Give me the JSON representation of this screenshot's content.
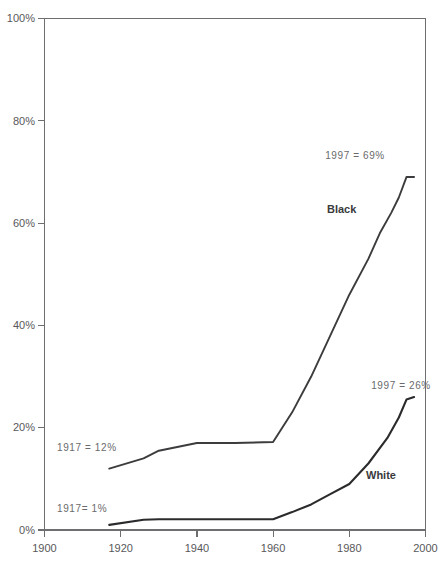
{
  "chart_data": {
    "type": "line",
    "title": "",
    "xlabel": "",
    "ylabel": "",
    "xlim": [
      1900,
      2000
    ],
    "ylim": [
      0,
      100
    ],
    "grid": false,
    "legend_position": "inline-labels",
    "xticks": [
      1900,
      1920,
      1940,
      1960,
      1980,
      2000
    ],
    "xtick_labels": [
      "1900",
      "1920",
      "1940",
      "1960",
      "1980",
      "2000"
    ],
    "yticks": [
      0,
      20,
      40,
      60,
      80,
      100
    ],
    "ytick_labels": [
      "0%",
      "20%",
      "40%",
      "60%",
      "80%",
      "100%"
    ],
    "series": [
      {
        "name": "Black",
        "label": "Black",
        "x": [
          1917,
          1926,
          1930,
          1940,
          1950,
          1960,
          1965,
          1970,
          1975,
          1980,
          1985,
          1988,
          1991,
          1993,
          1995,
          1997
        ],
        "values": [
          12,
          14,
          15.5,
          17,
          17,
          17.2,
          23,
          30,
          38,
          46,
          53,
          58,
          62,
          65,
          69,
          69
        ]
      },
      {
        "name": "White",
        "label": "White",
        "x": [
          1917,
          1926,
          1930,
          1940,
          1950,
          1960,
          1965,
          1970,
          1975,
          1980,
          1985,
          1990,
          1993,
          1995,
          1997
        ],
        "values": [
          1,
          2,
          2.1,
          2.1,
          2.1,
          2.1,
          3.5,
          5,
          7,
          9,
          13,
          18,
          22,
          25.5,
          26
        ]
      }
    ],
    "annotations": [
      {
        "name": "black-start-annotation",
        "text": "1917 = 12%",
        "x": 1917,
        "y": 12
      },
      {
        "name": "white-start-annotation",
        "text": "1917= 1%",
        "x": 1917,
        "y": 1
      },
      {
        "name": "black-end-annotation",
        "text": "1997 = 69%",
        "x": 1997,
        "y": 69
      },
      {
        "name": "white-end-annotation",
        "text": "1997 = 26%",
        "x": 1997,
        "y": 26
      }
    ]
  },
  "axis": {
    "y_labels": [
      "100%",
      "80%",
      "60%",
      "40%",
      "20%",
      "0%"
    ],
    "x_labels": [
      "1900",
      "1920",
      "1940",
      "1960",
      "1980",
      "2000"
    ]
  },
  "labels": {
    "black": "Black",
    "white": "White",
    "black_start": "1917 = 12%",
    "white_start": "1917= 1%",
    "black_end": "1997 = 69%",
    "white_end": "1997 = 26%"
  },
  "colors": {
    "line": "#3c3c3e",
    "axis": "#6e6e70",
    "tick_text": "#58585a",
    "annotation_text": "#6a6a6c",
    "series_label_text": "#3a3a3c",
    "background": "#ffffff"
  }
}
